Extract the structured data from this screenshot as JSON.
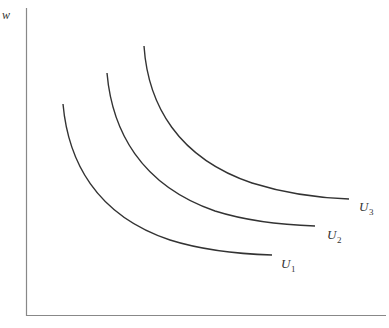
{
  "diagram": {
    "type": "indifference-curves",
    "y_axis_label": "w",
    "curves": [
      {
        "label": "U",
        "subscript": "1",
        "start": [
          63,
          104
        ],
        "end": [
          272,
          255
        ]
      },
      {
        "label": "U",
        "subscript": "2",
        "start": [
          107,
          73
        ],
        "end": [
          315,
          226
        ]
      },
      {
        "label": "U",
        "subscript": "3",
        "start": [
          144,
          46
        ],
        "end": [
          349,
          199
        ]
      }
    ],
    "colors": {
      "axis": "#888888",
      "curve": "#333333",
      "text": "#333333"
    }
  }
}
